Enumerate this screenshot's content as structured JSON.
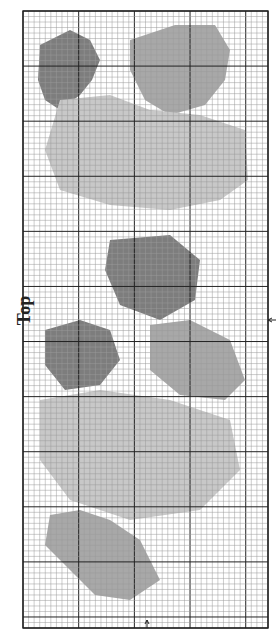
{
  "chart_label": "Top",
  "grid": {
    "left": 23,
    "top": 11,
    "right": 268,
    "bottom": 628,
    "cols": 44,
    "rows": 112,
    "major_every": 10,
    "minor_color": "#9a9a9a",
    "major_color": "#222222"
  },
  "colors": {
    "dark_fill": "#7d7d7d",
    "mid_fill": "#a8a8a8",
    "light_fill": "#c8c8c8",
    "black_stitch": "#1a1a1a"
  },
  "regions": [
    {
      "name": "leaf-top-left",
      "shade": "dark",
      "pts": "40,45 70,30 90,40 100,60 92,80 80,95 60,110 45,100 38,80"
    },
    {
      "name": "leaf-top-right",
      "shade": "mid",
      "pts": "130,40 175,25 215,25 230,50 225,80 205,105 170,115 145,100 130,70"
    },
    {
      "name": "flower-top",
      "shade": "light",
      "pts": "60,100 110,95 150,110 200,115 245,130 248,180 220,200 170,210 110,205 60,190 45,150"
    },
    {
      "name": "leaf-middle",
      "shade": "dark",
      "pts": "110,240 170,235 200,260 195,300 160,320 120,305 105,270"
    },
    {
      "name": "leaf-lower-left",
      "shade": "dark",
      "pts": "45,330 80,320 110,330 120,360 100,385 65,390 45,365"
    },
    {
      "name": "leaf-lower-right",
      "shade": "mid",
      "pts": "150,325 190,320 230,340 245,380 225,400 180,395 150,370"
    },
    {
      "name": "flower-bottom",
      "shade": "light",
      "pts": "40,400 100,390 170,400 230,420 240,470 200,510 130,520 70,500 40,460"
    },
    {
      "name": "sprig-bottom",
      "shade": "mid",
      "pts": "50,515 80,510 110,520 140,540 160,580 130,600 95,595 70,570 45,545"
    }
  ]
}
